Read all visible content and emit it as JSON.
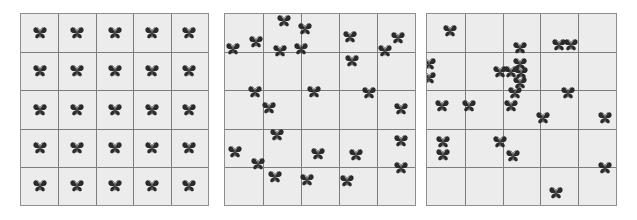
{
  "figure": {
    "name": "butterfly-spatial-distribution-panels",
    "background_color": "#ffffff",
    "width": 637,
    "height": 220,
    "icon_name": "butterfly-icon",
    "icon_color": "#2b2b2b",
    "panel_fill": "#ececec",
    "panel_border_color": "#8e8e8e",
    "gridline_color": "#7d7d7d"
  },
  "chart_data": {
    "type": "scatter",
    "title": "",
    "xlabel": "",
    "ylabel": "",
    "grid": true,
    "legend": "none",
    "xlim": [
      0,
      5
    ],
    "ylim": [
      0,
      5
    ],
    "marker": "butterfly-icon",
    "panels": [
      {
        "name": "uniform-distribution-panel",
        "label": "",
        "grid_rows": 5,
        "grid_cols": 5,
        "count": 25,
        "rect": {
          "x": 20,
          "y": 13,
          "w": 189,
          "h": 193
        },
        "points": [
          [
            0.5,
            0.5
          ],
          [
            1.5,
            0.5
          ],
          [
            2.5,
            0.5
          ],
          [
            3.5,
            0.5
          ],
          [
            4.5,
            0.5
          ],
          [
            0.5,
            1.5
          ],
          [
            1.5,
            1.5
          ],
          [
            2.5,
            1.5
          ],
          [
            3.5,
            1.5
          ],
          [
            4.5,
            1.5
          ],
          [
            0.5,
            2.5
          ],
          [
            1.5,
            2.5
          ],
          [
            2.5,
            2.5
          ],
          [
            3.5,
            2.5
          ],
          [
            4.5,
            2.5
          ],
          [
            0.5,
            3.5
          ],
          [
            1.5,
            3.5
          ],
          [
            2.5,
            3.5
          ],
          [
            3.5,
            3.5
          ],
          [
            4.5,
            3.5
          ],
          [
            0.5,
            4.5
          ],
          [
            1.5,
            4.5
          ],
          [
            2.5,
            4.5
          ],
          [
            3.5,
            4.5
          ],
          [
            4.5,
            4.5
          ]
        ]
      },
      {
        "name": "random-distribution-panel",
        "label": "",
        "grid_rows": 5,
        "grid_cols": 5,
        "count": 25,
        "rect": {
          "x": 224,
          "y": 13,
          "w": 192,
          "h": 193
        },
        "points": [
          [
            1.55,
            0.18
          ],
          [
            2.1,
            0.38
          ],
          [
            0.82,
            0.72
          ],
          [
            3.3,
            0.6
          ],
          [
            4.55,
            0.62
          ],
          [
            0.22,
            0.92
          ],
          [
            1.45,
            0.96
          ],
          [
            2.0,
            0.92
          ],
          [
            4.2,
            0.98
          ],
          [
            3.35,
            1.22
          ],
          [
            0.78,
            2.03
          ],
          [
            2.35,
            2.05
          ],
          [
            3.8,
            2.08
          ],
          [
            1.15,
            2.45
          ],
          [
            4.62,
            2.48
          ],
          [
            1.38,
            3.18
          ],
          [
            0.25,
            3.62
          ],
          [
            2.45,
            3.66
          ],
          [
            3.45,
            3.68
          ],
          [
            4.62,
            3.32
          ],
          [
            0.88,
            3.92
          ],
          [
            4.62,
            4.02
          ],
          [
            1.32,
            4.28
          ],
          [
            2.15,
            4.35
          ],
          [
            3.2,
            4.38
          ]
        ]
      },
      {
        "name": "clustered-distribution-panel",
        "label": "",
        "grid_rows": 5,
        "grid_cols": 5,
        "count": 25,
        "rect": {
          "x": 426,
          "y": 13,
          "w": 191,
          "h": 193
        },
        "points": [
          [
            0.62,
            0.45
          ],
          [
            2.45,
            0.88
          ],
          [
            3.48,
            0.82
          ],
          [
            3.82,
            0.8
          ],
          [
            0.04,
            1.32
          ],
          [
            0.04,
            1.68
          ],
          [
            2.45,
            1.32
          ],
          [
            1.92,
            1.52
          ],
          [
            2.22,
            1.52
          ],
          [
            2.48,
            1.55
          ],
          [
            2.45,
            1.8
          ],
          [
            2.32,
            2.08
          ],
          [
            3.72,
            2.08
          ],
          [
            0.4,
            2.42
          ],
          [
            1.1,
            2.42
          ],
          [
            2.22,
            2.42
          ],
          [
            3.08,
            2.72
          ],
          [
            4.72,
            2.72
          ],
          [
            0.42,
            3.35
          ],
          [
            0.42,
            3.7
          ],
          [
            1.92,
            3.35
          ],
          [
            2.28,
            3.72
          ],
          [
            4.72,
            4.02
          ],
          [
            3.42,
            4.68
          ]
        ]
      }
    ]
  }
}
